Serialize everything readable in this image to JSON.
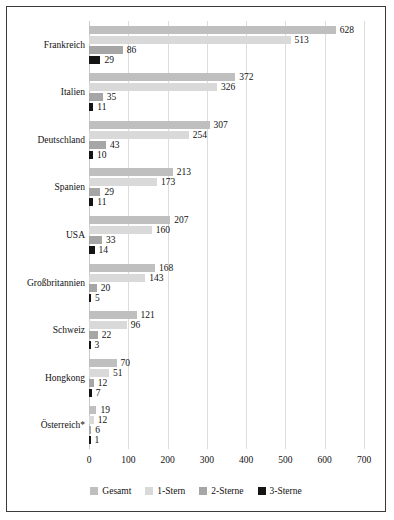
{
  "chart_data": {
    "type": "bar",
    "orientation": "horizontal",
    "title": "",
    "subtitle": "",
    "xlabel": "",
    "ylabel": "",
    "xlim": [
      0,
      700
    ],
    "xticks": [
      0,
      100,
      200,
      300,
      400,
      500,
      600,
      700
    ],
    "grid": true,
    "legend_position": "bottom",
    "categories": [
      "Frankreich",
      "Italien",
      "Deutschland",
      "Spanien",
      "USA",
      "Großbritannien",
      "Schweiz",
      "Hongkong",
      "Österreich*"
    ],
    "series": [
      {
        "name": "Gesamt",
        "color": "#bfbfbf",
        "values": [
          628,
          372,
          307,
          213,
          207,
          168,
          121,
          70,
          19
        ]
      },
      {
        "name": "1-Stern",
        "color": "#d9d9d9",
        "values": [
          513,
          326,
          254,
          173,
          160,
          143,
          96,
          51,
          12
        ]
      },
      {
        "name": "2-Sterne",
        "color": "#a6a6a6",
        "values": [
          86,
          35,
          43,
          29,
          33,
          20,
          22,
          12,
          6
        ]
      },
      {
        "name": "3-Sterne",
        "color": "#141414",
        "values": [
          29,
          11,
          10,
          11,
          14,
          5,
          3,
          7,
          1
        ]
      }
    ]
  },
  "legend": {
    "items": [
      {
        "label": "Gesamt",
        "color": "#bfbfbf"
      },
      {
        "label": "1-Stern",
        "color": "#d9d9d9"
      },
      {
        "label": "2-Sterne",
        "color": "#a6a6a6"
      },
      {
        "label": "3-Sterne",
        "color": "#141414"
      }
    ]
  }
}
